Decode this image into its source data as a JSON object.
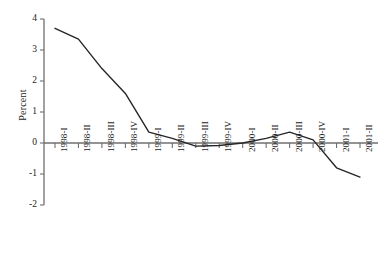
{
  "chart_data": {
    "type": "line",
    "title": "",
    "xlabel": "",
    "ylabel": "Percent",
    "categories": [
      "1998-I",
      "1998-II",
      "1998-III",
      "1998-IV",
      "1999-I",
      "1999-II",
      "1999-III",
      "1999-IV",
      "2000-I",
      "2000-II",
      "2000-III",
      "2000-IV",
      "2001-I",
      "2001-II"
    ],
    "values": [
      3.7,
      3.35,
      2.4,
      1.6,
      0.35,
      0.15,
      -0.1,
      -0.08,
      0.0,
      0.15,
      0.35,
      0.1,
      -0.8,
      -1.1
    ],
    "ylim": [
      -2,
      4
    ],
    "yticks": [
      4,
      3,
      2,
      1,
      0,
      -1,
      -2
    ],
    "ytick_labels": [
      "4",
      "3",
      "2",
      "1",
      "0",
      "-1",
      "-2"
    ],
    "grid": false,
    "legend": "none",
    "zero_line": 0,
    "series_color": "#262626",
    "axis_color": "#6f6f6f"
  }
}
